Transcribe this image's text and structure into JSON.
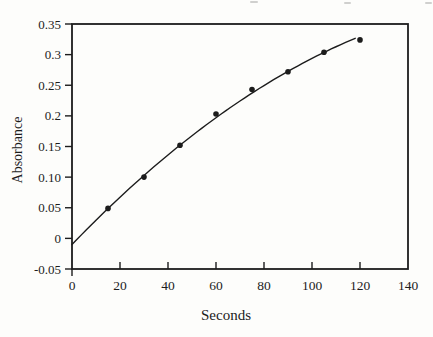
{
  "chart_data": {
    "type": "scatter",
    "title": "",
    "xlabel": "Seconds",
    "ylabel": "Absorbance",
    "xlim": [
      0,
      140
    ],
    "ylim": [
      -0.05,
      0.35
    ],
    "grid": false,
    "legend": false,
    "x": [
      15,
      30,
      45,
      60,
      75,
      90,
      105,
      120
    ],
    "y": [
      0.049,
      0.1,
      0.152,
      0.203,
      0.243,
      0.272,
      0.304,
      0.324
    ],
    "x_ticks": [
      {
        "v": 0,
        "label": "0"
      },
      {
        "v": 20,
        "label": "20"
      },
      {
        "v": 40,
        "label": "40"
      },
      {
        "v": 60,
        "label": "60"
      },
      {
        "v": 80,
        "label": "80"
      },
      {
        "v": 100,
        "label": "100"
      },
      {
        "v": 120,
        "label": "120"
      },
      {
        "v": 140,
        "label": "140"
      }
    ],
    "y_ticks": [
      {
        "v": -0.05,
        "label": "-0.05"
      },
      {
        "v": 0,
        "label": "0"
      },
      {
        "v": 0.05,
        "label": "0.05"
      },
      {
        "v": 0.1,
        "label": "0.10"
      },
      {
        "v": 0.15,
        "label": "0.15"
      },
      {
        "v": 0.2,
        "label": "0.2"
      },
      {
        "v": 0.25,
        "label": "0.25"
      },
      {
        "v": 0.3,
        "label": "0.3"
      },
      {
        "v": 0.35,
        "label": "0.35"
      }
    ],
    "fit_curve": {
      "type": "quadratic",
      "a": -0.01,
      "b": 0.004068,
      "c": -1.03e-05,
      "domain": [
        0,
        118
      ]
    },
    "marker": {
      "shape": "circle",
      "radius": 2.8,
      "color": "#1c1c1c"
    },
    "ink_color": "#1c1c1c",
    "background_color": "#fdfdfb"
  }
}
